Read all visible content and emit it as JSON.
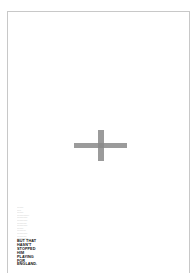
{
  "poster": {
    "symbol": "cross",
    "cross_color": "#8a8a8a",
    "border_color": "#c8c8c8",
    "body_copy_lines": [
      "xxxxxxxx",
      "xxxxx",
      "xxxxxxxx",
      "xxxxxxxxxxxxxxx",
      "xxxxxxxxxxxxx",
      "xxxxxxxxxxxxx",
      "xxxxxxxxxxxx",
      "xxxxxxxxxxxxx",
      "xxxxxxxx",
      "xxxxxxxxxxx",
      "xxxxxxxxxxxxx",
      "xxxxxxxxxxxx",
      "xxxxxxxxxxxxxx"
    ],
    "headline_lines": [
      "BUT THAT",
      "HASN'T",
      "STOPPED",
      "HIM",
      "PLAYING",
      "FOR",
      "ENGLAND."
    ]
  }
}
